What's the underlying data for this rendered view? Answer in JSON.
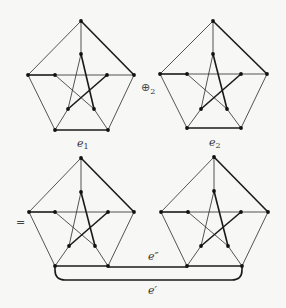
{
  "diagram": {
    "title": "",
    "graphs": [
      {
        "id": "top-left",
        "label": {
          "base": "e",
          "sub": "1",
          "x": 77,
          "y": 147
        },
        "nodes": {
          "ot": [
            81,
            21
          ],
          "ol": [
            28,
            75
          ],
          "or": [
            134,
            75
          ],
          "obl": [
            55,
            130
          ],
          "obr": [
            108,
            130
          ],
          "it": [
            81,
            54
          ],
          "il": [
            55,
            75
          ],
          "ir": [
            107,
            75
          ],
          "ibl": [
            68,
            109
          ],
          "ibr": [
            94,
            109
          ]
        }
      },
      {
        "id": "top-right",
        "label": {
          "base": "e",
          "sub": "2",
          "x": 209,
          "y": 146
        },
        "nodes": {
          "ot": [
            213,
            21
          ],
          "ol": [
            160,
            74
          ],
          "or": [
            267,
            74
          ],
          "obl": [
            187,
            128
          ],
          "obr": [
            241,
            128
          ],
          "it": [
            213,
            54
          ],
          "il": [
            187,
            74
          ],
          "ir": [
            241,
            74
          ],
          "ibl": [
            201,
            109
          ],
          "ibr": [
            227,
            109
          ]
        }
      },
      {
        "id": "bottom-left",
        "label": null,
        "nodes": {
          "ot": [
            81,
            158
          ],
          "ol": [
            29,
            212
          ],
          "or": [
            134,
            212
          ],
          "obl": [
            55,
            266
          ],
          "obr": [
            108,
            266
          ],
          "it": [
            81,
            192
          ],
          "il": [
            55,
            212
          ],
          "ir": [
            108,
            212
          ],
          "ibl": [
            69,
            246
          ],
          "ibr": [
            95,
            246
          ]
        }
      },
      {
        "id": "bottom-right",
        "label": null,
        "nodes": {
          "ot": [
            214,
            157
          ],
          "ol": [
            161,
            212
          ],
          "or": [
            268,
            212
          ],
          "obl": [
            187,
            266
          ],
          "obr": [
            242,
            266
          ],
          "it": [
            214,
            191
          ],
          "il": [
            188,
            212
          ],
          "ir": [
            241,
            212
          ],
          "ibl": [
            201,
            246
          ],
          "ibr": [
            228,
            246
          ]
        }
      }
    ],
    "edges": [
      {
        "a": "ot",
        "b": "ol",
        "bold": false
      },
      {
        "a": "ot",
        "b": "or",
        "bold": true
      },
      {
        "a": "ol",
        "b": "obl",
        "bold": false
      },
      {
        "a": "or",
        "b": "obr",
        "bold": false
      },
      {
        "a": "obl",
        "b": "obr",
        "bold": true
      },
      {
        "a": "ot",
        "b": "it",
        "bold": false
      },
      {
        "a": "ol",
        "b": "il",
        "bold": true
      },
      {
        "a": "or",
        "b": "ir",
        "bold": false
      },
      {
        "a": "obl",
        "b": "ibl",
        "bold": false
      },
      {
        "a": "obr",
        "b": "ibr",
        "bold": false
      },
      {
        "a": "it",
        "b": "ibl",
        "bold": false
      },
      {
        "a": "it",
        "b": "ibr",
        "bold": true
      },
      {
        "a": "il",
        "b": "ir",
        "bold": false
      },
      {
        "a": "il",
        "b": "ibr",
        "bold": false
      },
      {
        "a": "ir",
        "b": "ibl",
        "bold": true
      }
    ],
    "operators": {
      "oplus": {
        "symbol": "⊕",
        "sub": "2",
        "x": 141,
        "y": 91
      },
      "equals": {
        "symbol": "=",
        "x": 16,
        "y": 226
      }
    },
    "connecting_edges": {
      "e_double_prime": {
        "label": "e″",
        "from": [
          108,
          267
        ],
        "to": [
          188,
          267
        ],
        "label_x": 148,
        "label_y": 260
      },
      "e_prime": {
        "label": "e′",
        "from": [
          55,
          266
        ],
        "to": [
          242,
          266
        ],
        "bottom_y": 280,
        "radius": 10,
        "label_x": 148,
        "label_y": 294
      }
    }
  }
}
